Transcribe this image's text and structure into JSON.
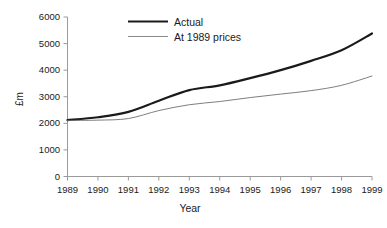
{
  "chart_data": {
    "type": "line",
    "title": "",
    "xlabel": "Year",
    "ylabel": "£m",
    "categories": [
      "1989",
      "1990",
      "1991",
      "1992",
      "1993",
      "1994",
      "1995",
      "1996",
      "1997",
      "1998",
      "1999"
    ],
    "x": [
      1989,
      1990,
      1991,
      1992,
      1993,
      1994,
      1995,
      1996,
      1997,
      1998,
      1999
    ],
    "xlim": [
      1989,
      1999
    ],
    "ylim": [
      0,
      6000
    ],
    "yticks": [
      0,
      1000,
      2000,
      3000,
      4000,
      5000,
      6000
    ],
    "ytick_labels": [
      "0",
      "1000",
      "2000",
      "3000",
      "4000",
      "5000",
      "6000"
    ],
    "xtick_labels": [
      "1989",
      "1990",
      "1991",
      "1992",
      "1993",
      "1994",
      "1995",
      "1996",
      "1997",
      "1998",
      "1999"
    ],
    "grid": false,
    "legend_position": "top-center",
    "series": [
      {
        "name": "Actual",
        "color": "#1a1a1a",
        "line_width": 2.2,
        "values": [
          2120,
          2230,
          2430,
          2850,
          3250,
          3430,
          3700,
          4000,
          4350,
          4750,
          5380
        ]
      },
      {
        "name": "At 1989 prices",
        "color": "#6f6f6f",
        "line_width": 0.9,
        "values": [
          2110,
          2120,
          2180,
          2480,
          2700,
          2820,
          2970,
          3100,
          3230,
          3430,
          3780
        ]
      }
    ]
  },
  "legend": {
    "items": [
      {
        "label": "Actual"
      },
      {
        "label": "At 1989 prices"
      }
    ]
  },
  "axes": {
    "y_title": "£m",
    "x_title": "Year"
  },
  "colors": {
    "axis": "#9a9a9a",
    "text": "#1a1a1a",
    "series_actual": "#1a1a1a",
    "series_prices": "#6f6f6f",
    "background": "#ffffff"
  }
}
